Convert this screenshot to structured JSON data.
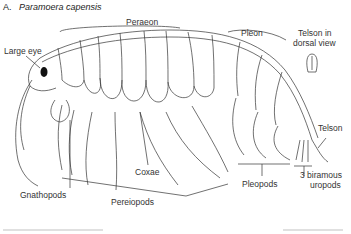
{
  "figure": {
    "panel_letter": "A.",
    "species": "Paramoera capensis"
  },
  "labels": {
    "large_eye": "Large eye",
    "peraeon": "Peraeon",
    "pleon": "Pleon",
    "telson_dorsal": [
      "Telson in",
      "dorsal view"
    ],
    "telson": "Telson",
    "coxae": "Coxae",
    "gnathopods": "Gnathopods",
    "pereiopods": "Pereiopods",
    "pleopods": "Pleopods",
    "uropods": [
      "3 biramous",
      "uropods"
    ]
  }
}
